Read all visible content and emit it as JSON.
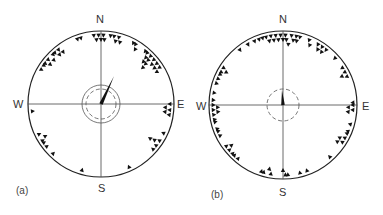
{
  "panels": [
    {
      "id": "a",
      "label": "(a)",
      "compass": {
        "n": "N",
        "s": "S",
        "e": "E",
        "w": "W"
      },
      "center": [
        101,
        104
      ],
      "radius": 73,
      "mean_vector": {
        "bearing_deg": 25,
        "length_frac": 0.42
      },
      "inner_circles": [
        {
          "r": 19,
          "style": "solid"
        },
        {
          "r": 15,
          "style": "dashed"
        }
      ],
      "bearings_deg": [
        -20,
        -17,
        -6,
        -4,
        -2,
        0,
        2,
        3,
        8,
        11,
        13,
        15,
        17,
        28,
        30,
        32,
        40,
        42,
        44,
        45,
        46,
        47,
        48,
        49,
        50,
        52,
        54,
        56,
        58,
        60,
        90,
        93,
        95,
        97,
        99,
        115,
        122,
        124,
        125,
        127,
        131,
        156,
        196,
        224,
        232,
        236,
        238,
        240,
        244,
        264,
        300,
        304,
        306,
        308,
        310,
        313,
        316,
        318,
        320,
        322,
        324
      ]
    },
    {
      "id": "b",
      "label": "(b)",
      "compass": {
        "n": "N",
        "s": "S",
        "e": "E",
        "w": "W"
      },
      "center": [
        283,
        105
      ],
      "radius": 74,
      "mean_vector": {
        "bearing_deg": -4,
        "length_frac": 0.2
      },
      "inner_circles": [
        {
          "r": 16,
          "style": "dashed"
        }
      ],
      "bearings_deg": [
        -38,
        -30,
        -24,
        -20,
        -17,
        -14,
        -12,
        -10,
        -8,
        -6,
        -4,
        -2,
        0,
        2,
        3,
        5,
        7,
        9,
        11,
        12,
        14,
        22,
        24,
        30,
        32,
        34,
        36,
        38,
        48,
        58,
        62,
        64,
        66,
        88,
        90,
        92,
        94,
        96,
        106,
        112,
        114,
        118,
        120,
        122,
        124,
        138,
        160,
        166,
        176,
        178,
        180,
        190,
        192,
        196,
        198,
        220,
        224,
        226,
        230,
        232,
        234,
        244,
        248,
        250,
        256,
        258,
        262,
        264,
        266,
        268,
        270,
        274,
        280,
        288,
        292,
        296,
        298,
        300,
        302
      ]
    }
  ]
}
